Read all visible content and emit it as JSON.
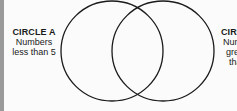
{
  "diagram": {
    "type": "venn",
    "circles": [
      {
        "id": "A",
        "title": "CIRCLE A",
        "line1": "Numbers",
        "line2": "less than 5"
      },
      {
        "id": "B",
        "title": "CIRCLE B",
        "line1": "Numbers",
        "line2": "greater",
        "line3": "than"
      }
    ],
    "stroke_color": "#1a1a1a",
    "background": "#fbfbfb"
  }
}
